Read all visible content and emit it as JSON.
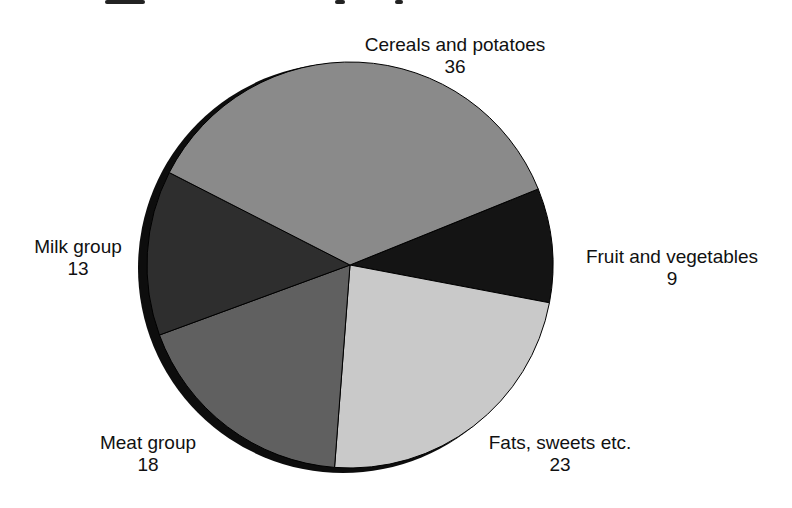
{
  "chart_data": {
    "type": "pie",
    "title": "",
    "center": [
      350,
      265
    ],
    "radius": 203,
    "start_angle_deg": -22,
    "slices": [
      {
        "name": "Fruit and vegetables",
        "value": 9,
        "fill": "#141414"
      },
      {
        "name": "Fats, sweets etc.",
        "value": 23,
        "fill": "#c9c9c9"
      },
      {
        "name": "Meat group",
        "value": 18,
        "fill": "#606060"
      },
      {
        "name": "Milk group",
        "value": 13,
        "fill": "#2e2e2e"
      },
      {
        "name": "Cereals and potatoes",
        "value": 36,
        "fill": "#8a8a8a"
      }
    ],
    "labels_position": "outside",
    "legend": "none"
  },
  "labels": {
    "cereals": {
      "name": "Cereals and potatoes",
      "value": "36"
    },
    "fruit": {
      "name": "Fruit and vegetables",
      "value": "9"
    },
    "fats": {
      "name": "Fats, sweets etc.",
      "value": "23"
    },
    "meat": {
      "name": "Meat group",
      "value": "18"
    },
    "milk": {
      "name": "Milk group",
      "value": "13"
    }
  }
}
